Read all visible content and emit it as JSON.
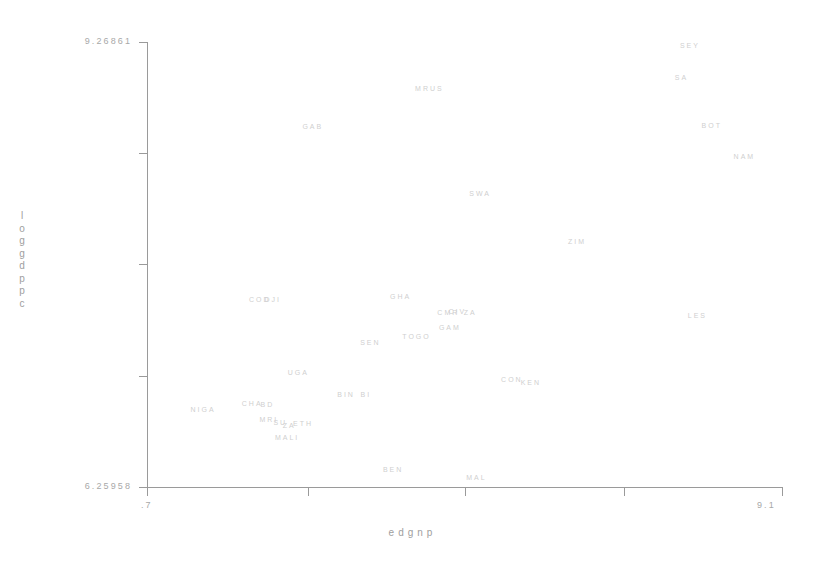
{
  "chart_data": {
    "type": "scatter",
    "title": "",
    "xlabel": "edgnp",
    "ylabel": "loggdppc",
    "xlim": [
      0.7,
      9.1
    ],
    "ylim": [
      6.25958,
      9.26861
    ],
    "grid": false,
    "legend": null,
    "marker_style": "text-label",
    "x_ticks": [
      ".7",
      "9.1"
    ],
    "y_ticks": [
      "6.25958",
      "9.26861"
    ],
    "points": [
      {
        "label": "SEY",
        "x": 7.87,
        "y": 9.25
      },
      {
        "label": "SA",
        "x": 7.76,
        "y": 9.03
      },
      {
        "label": "MRUS",
        "x": 4.43,
        "y": 8.96
      },
      {
        "label": "BOT",
        "x": 8.16,
        "y": 8.71
      },
      {
        "label": "GAB",
        "x": 2.89,
        "y": 8.7
      },
      {
        "label": "NAM",
        "x": 8.59,
        "y": 8.5
      },
      {
        "label": "SWA",
        "x": 5.1,
        "y": 8.25
      },
      {
        "label": "ZIM",
        "x": 6.38,
        "y": 7.92
      },
      {
        "label": "COD",
        "x": 2.19,
        "y": 7.53
      },
      {
        "label": "DJI",
        "x": 2.36,
        "y": 7.53
      },
      {
        "label": "GHA",
        "x": 4.05,
        "y": 7.55
      },
      {
        "label": "CIV",
        "x": 4.8,
        "y": 7.45
      },
      {
        "label": "CMR",
        "x": 4.68,
        "y": 7.44
      },
      {
        "label": "ZA",
        "x": 4.97,
        "y": 7.44
      },
      {
        "label": "LES",
        "x": 7.97,
        "y": 7.42
      },
      {
        "label": "GAM",
        "x": 4.7,
        "y": 7.34
      },
      {
        "label": "TOGO",
        "x": 4.26,
        "y": 7.28
      },
      {
        "label": "SEN",
        "x": 3.65,
        "y": 7.24
      },
      {
        "label": "UGA",
        "x": 2.7,
        "y": 7.04
      },
      {
        "label": "CON",
        "x": 5.52,
        "y": 6.99
      },
      {
        "label": "KEN",
        "x": 5.77,
        "y": 6.97
      },
      {
        "label": "BIN",
        "x": 3.33,
        "y": 6.89
      },
      {
        "label": "BI",
        "x": 3.59,
        "y": 6.89
      },
      {
        "label": "CHA",
        "x": 2.09,
        "y": 6.83
      },
      {
        "label": "BD",
        "x": 2.29,
        "y": 6.82
      },
      {
        "label": "NIGA",
        "x": 1.44,
        "y": 6.79
      },
      {
        "label": "MRI",
        "x": 2.31,
        "y": 6.72
      },
      {
        "label": "SU",
        "x": 2.46,
        "y": 6.7
      },
      {
        "label": "ZA",
        "x": 2.58,
        "y": 6.68
      },
      {
        "label": "ETH",
        "x": 2.76,
        "y": 6.69
      },
      {
        "label": "MALI",
        "x": 2.55,
        "y": 6.6
      },
      {
        "label": "BEN",
        "x": 3.95,
        "y": 6.38
      },
      {
        "label": "MAL",
        "x": 5.05,
        "y": 6.33
      }
    ]
  },
  "axes": {
    "y_top_label": "9.26861",
    "y_bottom_label": "6.25958",
    "x_left_label": ".7",
    "x_right_label": "9.1",
    "x_title": "edgnp",
    "y_title_chars": [
      "l",
      "o",
      "g",
      "g",
      "d",
      "p",
      "p",
      "c"
    ]
  },
  "colors": {
    "axis": "#9a9a9a",
    "axis_text": "#a8a8a8",
    "point_text": "#cfcfcf",
    "background": "#ffffff"
  }
}
